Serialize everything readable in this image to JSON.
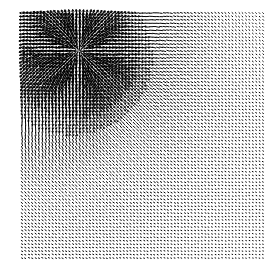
{
  "figure": {
    "title": "",
    "background_color": "#ffffff",
    "width": 278,
    "height": 279,
    "arrow_color": "#000000"
  },
  "plot": {
    "frame_visible": false,
    "axes_visible": false,
    "ticks_visible": false,
    "legend_visible": false,
    "colorbar_visible": false,
    "left_px": 22,
    "top_px": 13,
    "right_px": 263,
    "bottom_px": 258
  },
  "chart_data": {
    "type": "quiver",
    "title": "",
    "subtitle": "",
    "xlabel": "",
    "ylabel": "",
    "xlim": [
      0,
      1
    ],
    "ylim": [
      0,
      1
    ],
    "grid": false,
    "legend": null,
    "annotations": [],
    "tick_labels_x": [],
    "tick_labels_y": [],
    "grid_cols": 72,
    "grid_rows": 72,
    "spacing_px": 3.36,
    "arrow_max_length_px": 9.5,
    "arrow_min_length_px": 1.1,
    "arrow_stroke_width": 1.0,
    "critical_points": [
      {
        "name": "source",
        "x": 0.24,
        "y": 0.84,
        "type": "source"
      }
    ],
    "field_model": {
      "source_x": 0.24,
      "source_y": 0.84,
      "source_strength": 0.052,
      "source_softening": 0.012,
      "shear_x": 0.3,
      "shear_y": -0.22,
      "decay_scale": 0.62,
      "swirl": 0.35
    },
    "series": [
      {
        "name": "vector field",
        "color": "#000000",
        "sample_points": [
          {
            "x": 0.1,
            "y": 0.95,
            "u": -0.62,
            "v": 0.28,
            "mag": 0.68
          },
          {
            "x": 0.3,
            "y": 0.95,
            "u": -0.48,
            "v": 0.42,
            "mag": 0.64
          },
          {
            "x": 0.5,
            "y": 0.95,
            "u": -0.3,
            "v": 0.18,
            "mag": 0.35
          },
          {
            "x": 0.7,
            "y": 0.95,
            "u": -0.14,
            "v": 0.08,
            "mag": 0.16
          },
          {
            "x": 0.9,
            "y": 0.95,
            "u": -0.06,
            "v": 0.03,
            "mag": 0.07
          },
          {
            "x": 0.1,
            "y": 0.75,
            "u": -0.55,
            "v": -0.5,
            "mag": 0.74
          },
          {
            "x": 0.3,
            "y": 0.75,
            "u": 0.1,
            "v": -0.8,
            "mag": 0.81
          },
          {
            "x": 0.5,
            "y": 0.75,
            "u": 0.58,
            "v": -0.36,
            "mag": 0.68
          },
          {
            "x": 0.7,
            "y": 0.75,
            "u": 0.38,
            "v": -0.22,
            "mag": 0.44
          },
          {
            "x": 0.9,
            "y": 0.75,
            "u": 0.16,
            "v": -0.1,
            "mag": 0.19
          },
          {
            "x": 0.1,
            "y": 0.5,
            "u": -0.12,
            "v": -0.7,
            "mag": 0.71
          },
          {
            "x": 0.3,
            "y": 0.5,
            "u": 0.2,
            "v": -0.62,
            "mag": 0.65
          },
          {
            "x": 0.5,
            "y": 0.5,
            "u": 0.42,
            "v": -0.4,
            "mag": 0.58
          },
          {
            "x": 0.7,
            "y": 0.5,
            "u": 0.28,
            "v": -0.22,
            "mag": 0.36
          },
          {
            "x": 0.9,
            "y": 0.5,
            "u": 0.12,
            "v": -0.09,
            "mag": 0.15
          },
          {
            "x": 0.1,
            "y": 0.25,
            "u": -0.05,
            "v": -0.36,
            "mag": 0.36
          },
          {
            "x": 0.3,
            "y": 0.25,
            "u": 0.14,
            "v": -0.32,
            "mag": 0.35
          },
          {
            "x": 0.5,
            "y": 0.25,
            "u": 0.22,
            "v": -0.22,
            "mag": 0.31
          },
          {
            "x": 0.7,
            "y": 0.25,
            "u": 0.16,
            "v": -0.13,
            "mag": 0.21
          },
          {
            "x": 0.9,
            "y": 0.25,
            "u": 0.08,
            "v": -0.06,
            "mag": 0.1
          },
          {
            "x": 0.1,
            "y": 0.05,
            "u": -0.03,
            "v": -0.14,
            "mag": 0.14
          },
          {
            "x": 0.3,
            "y": 0.05,
            "u": 0.07,
            "v": -0.13,
            "mag": 0.15
          },
          {
            "x": 0.5,
            "y": 0.05,
            "u": 0.1,
            "v": -0.1,
            "mag": 0.14
          },
          {
            "x": 0.7,
            "y": 0.05,
            "u": 0.08,
            "v": -0.07,
            "mag": 0.11
          },
          {
            "x": 0.9,
            "y": 0.05,
            "u": 0.05,
            "v": -0.04,
            "mag": 0.06
          }
        ]
      }
    ]
  }
}
